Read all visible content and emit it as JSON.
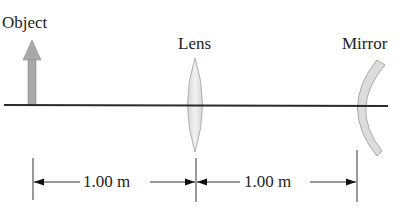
{
  "labels": {
    "object": "Object",
    "lens": "Lens",
    "mirror": "Mirror"
  },
  "dimensions": [
    {
      "label": "1.00 m",
      "from": "object",
      "to": "lens"
    },
    {
      "label": "1.00 m",
      "from": "lens",
      "to": "mirror"
    }
  ],
  "colors": {
    "axis": "#2a2a2a",
    "object_arrow": "#a9a9a9",
    "lens_fill": "#e4e4e4",
    "mirror_fill": "#dcdcdc",
    "dimension_lines": "#222222"
  }
}
